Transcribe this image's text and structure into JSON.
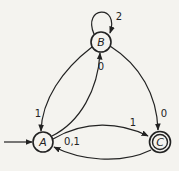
{
  "diagram": {
    "type": "finite-automaton",
    "states": [
      {
        "id": "A",
        "label": "A",
        "start": true,
        "accepting": false
      },
      {
        "id": "B",
        "label": "B",
        "start": false,
        "accepting": false
      },
      {
        "id": "C",
        "label": "C",
        "start": false,
        "accepting": true
      }
    ],
    "transitions": [
      {
        "from": "B",
        "to": "B",
        "label": "2"
      },
      {
        "from": "B",
        "to": "A",
        "label": "1"
      },
      {
        "from": "A",
        "to": "B",
        "label": "0"
      },
      {
        "from": "B",
        "to": "C",
        "label": "0"
      },
      {
        "from": "A",
        "to": "C",
        "label": "1"
      },
      {
        "from": "C",
        "to": "A",
        "label": "0,1"
      }
    ],
    "colors": {
      "stroke": "#222222",
      "background": "#f4f3ef"
    }
  }
}
